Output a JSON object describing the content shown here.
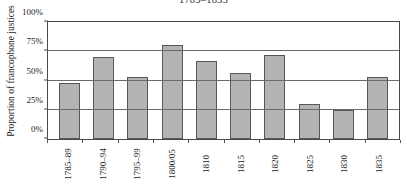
{
  "chart_data": {
    "type": "bar",
    "title": "1785–1835",
    "xlabel": "",
    "ylabel": "Proportion of francophone justices",
    "ylim": [
      0,
      100
    ],
    "yticks": [
      0,
      25,
      50,
      75,
      100
    ],
    "ytick_labels": [
      "0%",
      "25%",
      "50%",
      "75%",
      "100%"
    ],
    "grid": "horizontal",
    "legend": "none",
    "categories": [
      "1785–89",
      "1790–94",
      "1795–99",
      "1800/05",
      "1810",
      "1815",
      "1820",
      "1825",
      "1830",
      "1835"
    ],
    "values": [
      48,
      70,
      53,
      80,
      67,
      56,
      72,
      30,
      25,
      53
    ],
    "units": "percent",
    "bar_fill_color": "#b4b4b4",
    "bar_edge_color": "#585858",
    "axis_color": "#4a4a4a",
    "background_color": "#ffffff"
  }
}
